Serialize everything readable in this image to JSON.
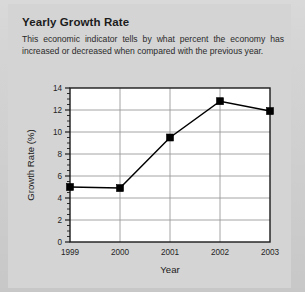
{
  "header": {
    "title": "Yearly Growth Rate",
    "subtitle": "This economic indicator tells by what percent the economy has increased or decreased when compared with the previous year."
  },
  "colors": {
    "page_background": "#d2d2d2",
    "plot_background": "#ffffff",
    "line": "#000000",
    "marker": "#000000",
    "gridline": "#9a9a9a",
    "axis": "#1a1a1a",
    "text": "#1c1c1c"
  },
  "chart_data": {
    "type": "line",
    "title": "Yearly Growth Rate",
    "subtitle": "This economic indicator tells by what percent the economy has increased or decreased when compared with the previous year.",
    "categories": [
      "1999",
      "2000",
      "2001",
      "2002",
      "2003"
    ],
    "values": [
      5.0,
      4.9,
      9.5,
      12.8,
      11.9
    ],
    "xlabel": "Year",
    "ylabel": "Growth Rate (%)",
    "ylim": [
      0,
      14
    ],
    "ytick_labels": [
      "0",
      "2",
      "4",
      "6",
      "8",
      "10",
      "12",
      "14"
    ],
    "ytick_values": [
      0,
      2,
      4,
      6,
      8,
      10,
      12,
      14
    ],
    "yminor_interval": 0.5,
    "grid": "horizontal-and-vertical",
    "legend": "none",
    "marker_style": "filled-square",
    "series": [
      {
        "name": "Growth Rate (%)",
        "values": [
          5.0,
          4.9,
          9.5,
          12.8,
          11.9
        ]
      }
    ]
  }
}
